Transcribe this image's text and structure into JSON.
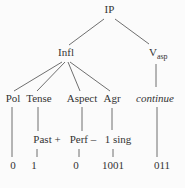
{
  "colors": {
    "background": "#fbfbfb",
    "text": "#333333",
    "line": "#5f5f5f"
  },
  "tree": {
    "type": "syntax-tree",
    "root": "IP",
    "branches": {
      "infl": "Infl",
      "v_base": "V",
      "v_subscript": "asp"
    },
    "heads": {
      "pol": "Pol",
      "tense": "Tense",
      "aspect": "Aspect",
      "agr": "Agr",
      "verb": "continue"
    },
    "feature_values": {
      "tense": "Past +",
      "aspect": "Perf –",
      "agr": "1 sing"
    },
    "codes": {
      "pol": "0",
      "tense": "1",
      "aspect": "0",
      "agr": "1001",
      "verb": "011"
    }
  }
}
